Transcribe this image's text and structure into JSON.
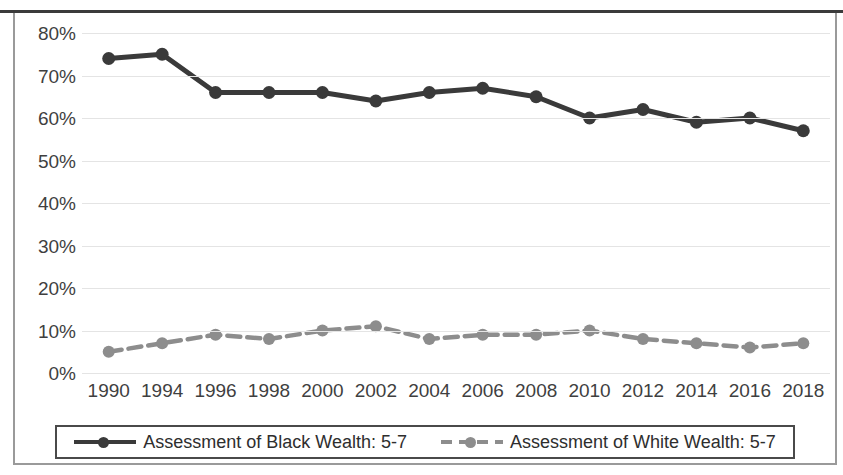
{
  "chart_data": {
    "type": "line",
    "title": "",
    "xlabel": "",
    "ylabel": "",
    "ylim": [
      0,
      80
    ],
    "ytick_labels": [
      "80%",
      "70%",
      "60%",
      "50%",
      "40%",
      "30%",
      "20%",
      "10%",
      "0%"
    ],
    "ytick_values": [
      80,
      70,
      60,
      50,
      40,
      30,
      20,
      10,
      0
    ],
    "grid": true,
    "legend_position": "bottom",
    "categories": [
      "1990",
      "1994",
      "1996",
      "1998",
      "2000",
      "2002",
      "2004",
      "2006",
      "2008",
      "2010",
      "2012",
      "2014",
      "2016",
      "2018"
    ],
    "series": [
      {
        "name": "Assessment of Black Wealth: 5-7",
        "values": [
          74,
          75,
          66,
          66,
          66,
          64,
          66,
          67,
          65,
          60,
          62,
          59,
          60,
          57
        ],
        "color": "#3a3a3a",
        "style": "solid",
        "marker": "circle"
      },
      {
        "name": "Assessment of White Wealth: 5-7",
        "values": [
          5,
          7,
          9,
          8,
          10,
          11,
          8,
          9,
          9,
          10,
          8,
          7,
          6,
          7
        ],
        "color": "#8d8d8d",
        "style": "dashed",
        "marker": "circle"
      }
    ]
  },
  "legend": {
    "items": [
      {
        "label": "Assessment of Black Wealth: 5-7",
        "swatch": "black-solid-line-marker"
      },
      {
        "label": "Assessment of White Wealth: 5-7",
        "swatch": "gray-dashed-line-marker"
      }
    ]
  },
  "colors": {
    "black_series": "#3a3a3a",
    "white_series": "#8d8d8d",
    "gridline": "#e4e4e4",
    "frame": "#9a9a9a",
    "text": "#3f3f3f"
  }
}
